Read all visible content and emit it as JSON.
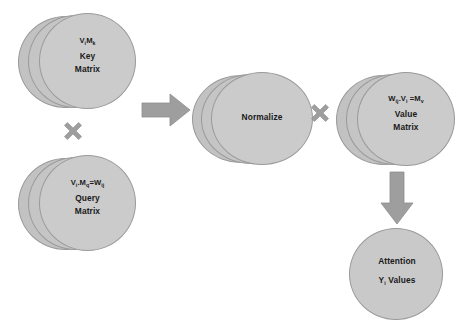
{
  "diagram": {
    "background_color": "#ffffff",
    "node_fill_color": "#c9c9c9",
    "node_stroke_color": "#9a9a9a",
    "operator_color": "#9e9e9e",
    "arrow_color": "#9e9e9e",
    "text_color": "#1a1a1a"
  },
  "nodes": {
    "key_matrix": {
      "formula_base1": "V",
      "formula_sub1": "i",
      "formula_mid": "M",
      "formula_sub2": "k",
      "line1": "Key",
      "line2": "Matrix",
      "shape": "disc-stack",
      "disc_count": 3
    },
    "query_matrix": {
      "formula_base1": "V",
      "formula_sub1": "i",
      "formula_dot": ".",
      "formula_mid": "M",
      "formula_sub2": "q",
      "formula_eq": "=W",
      "formula_sub3": "ij",
      "line1": "Query",
      "line2": "Matrix",
      "shape": "disc-stack",
      "disc_count": 3
    },
    "normalize": {
      "label": "Normalize",
      "shape": "disc-stack",
      "disc_count": 3
    },
    "value_matrix": {
      "formula_base1": "W",
      "formula_sub1": "ij",
      "formula_dot": ".",
      "formula_mid": "V",
      "formula_sub2": "i",
      "formula_eq": " =M",
      "formula_sub3": "v",
      "line1": "Value",
      "line2": "Matrix",
      "shape": "disc-stack",
      "disc_count": 3
    },
    "attention_output": {
      "line1": "Attention",
      "line2_base": "Y",
      "line2_sub": "i",
      "line2_rest": " Values",
      "shape": "circle"
    }
  },
  "operators": {
    "multiply_left": {
      "symbol": "×",
      "name": "multiplication"
    },
    "multiply_right": {
      "symbol": "×",
      "name": "multiplication"
    }
  },
  "arrows": {
    "to_normalize": {
      "direction": "right"
    },
    "to_attention": {
      "direction": "down"
    }
  }
}
